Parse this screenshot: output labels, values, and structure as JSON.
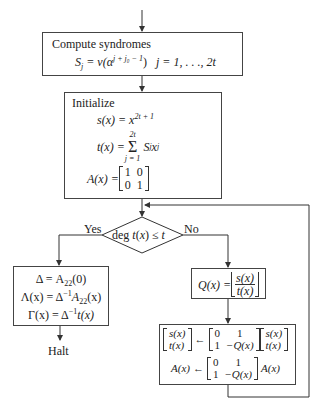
{
  "diagram": {
    "type": "flowchart",
    "nodes": {
      "compute": {
        "heading": "Compute syndromes",
        "formula_lhs": "S",
        "formula_lhs_sub": "j",
        "formula_mid": " = v(α",
        "formula_exp": "j + j₀ − 1",
        "formula_close": ")",
        "formula_range": "j = 1, . . ., 2t"
      },
      "initialize": {
        "heading": "Initialize",
        "s_lhs": "s(x) = x",
        "s_exp": "2t + 1",
        "t_lhs": "t(x) = ",
        "t_sum_top": "2t",
        "t_sum_sig": "Σ",
        "t_sum_bottom": "j = 1",
        "t_rhs": "S",
        "t_rhs_sub": "j",
        "t_rhs_x": "x",
        "t_rhs_exp": "j",
        "a_lhs": "A(x) = ",
        "a_matrix": [
          "1",
          "0",
          "0",
          "1"
        ]
      },
      "decision": {
        "condition": "deg t(x) ≤ t",
        "yes_label": "Yes",
        "no_label": "No"
      },
      "result": {
        "line1_lhs": "Δ = A",
        "line1_sub": "22",
        "line1_rhs": "(0)",
        "line2_lhs": "Λ(x) = Δ",
        "line2_exp": "−1",
        "line2_mid": "A",
        "line2_sub": "22",
        "line2_rhs": "(x)",
        "line3_lhs": "Γ(x) = Δ",
        "line3_exp": "−1",
        "line3_rhs": "t(x)"
      },
      "halt": {
        "label": "Halt"
      },
      "quotient": {
        "lhs": "Q(x) = ",
        "num": "s(x)",
        "den": "t(x)"
      },
      "update": {
        "vec_lhs": [
          "s(x)",
          "t(x)"
        ],
        "arrow": "←",
        "matrix": [
          "0",
          "1",
          "1",
          "−Q(x)"
        ],
        "vec_rhs": [
          "s(x)",
          "t(x)"
        ],
        "a_lhs": "A(x)",
        "a_matrix": [
          "0",
          "1",
          "1",
          "−Q(x)"
        ],
        "a_rhs": "A(x)"
      }
    },
    "edges": [
      {
        "from": "start",
        "to": "compute"
      },
      {
        "from": "compute",
        "to": "initialize"
      },
      {
        "from": "initialize",
        "to": "decision"
      },
      {
        "from": "decision",
        "to": "result",
        "label": "Yes"
      },
      {
        "from": "decision",
        "to": "quotient",
        "label": "No"
      },
      {
        "from": "result",
        "to": "halt"
      },
      {
        "from": "quotient",
        "to": "update"
      },
      {
        "from": "update",
        "to": "decision",
        "type": "loop"
      }
    ],
    "colors": {
      "line": "#333333",
      "background": "#ffffff"
    }
  }
}
